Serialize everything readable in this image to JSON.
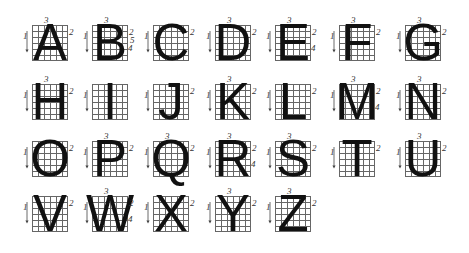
{
  "letters": [
    {
      "char": "A",
      "x": 32,
      "y": 25,
      "strokes": [
        "1",
        "2",
        "3"
      ]
    },
    {
      "char": "B",
      "x": 92,
      "y": 25,
      "strokes": [
        "1",
        "2",
        "3",
        "4",
        "5"
      ]
    },
    {
      "char": "C",
      "x": 153,
      "y": 25,
      "strokes": [
        "1",
        "2"
      ]
    },
    {
      "char": "D",
      "x": 215,
      "y": 25,
      "strokes": [
        "1",
        "2",
        "3"
      ]
    },
    {
      "char": "E",
      "x": 275,
      "y": 25,
      "strokes": [
        "1",
        "2",
        "3",
        "4"
      ]
    },
    {
      "char": "F",
      "x": 339,
      "y": 25,
      "strokes": [
        "1",
        "2",
        "3"
      ]
    },
    {
      "char": "G",
      "x": 405,
      "y": 25,
      "strokes": [
        "1",
        "2",
        "3"
      ]
    },
    {
      "char": "H",
      "x": 32,
      "y": 84,
      "strokes": [
        "1",
        "2",
        "3"
      ]
    },
    {
      "char": "I",
      "x": 92,
      "y": 84,
      "strokes": [
        "1"
      ]
    },
    {
      "char": "J",
      "x": 153,
      "y": 84,
      "strokes": [
        "1",
        "2"
      ]
    },
    {
      "char": "K",
      "x": 215,
      "y": 84,
      "strokes": [
        "1",
        "2",
        "3"
      ]
    },
    {
      "char": "L",
      "x": 275,
      "y": 84,
      "strokes": [
        "1",
        "2"
      ]
    },
    {
      "char": "M",
      "x": 339,
      "y": 84,
      "strokes": [
        "1",
        "2",
        "3",
        "4"
      ]
    },
    {
      "char": "N",
      "x": 405,
      "y": 84,
      "strokes": [
        "1",
        "2",
        "3"
      ]
    },
    {
      "char": "O",
      "x": 32,
      "y": 141,
      "strokes": [
        "1",
        "2"
      ]
    },
    {
      "char": "P",
      "x": 92,
      "y": 141,
      "strokes": [
        "1",
        "2",
        "3"
      ]
    },
    {
      "char": "Q",
      "x": 153,
      "y": 141,
      "strokes": [
        "1",
        "2",
        "3"
      ]
    },
    {
      "char": "R",
      "x": 215,
      "y": 141,
      "strokes": [
        "1",
        "2",
        "3",
        "4"
      ]
    },
    {
      "char": "S",
      "x": 275,
      "y": 141,
      "strokes": [
        "1",
        "2",
        "3"
      ]
    },
    {
      "char": "T",
      "x": 339,
      "y": 141,
      "strokes": [
        "1",
        "2"
      ]
    },
    {
      "char": "U",
      "x": 405,
      "y": 141,
      "strokes": [
        "1",
        "2",
        "3"
      ]
    },
    {
      "char": "V",
      "x": 32,
      "y": 196,
      "strokes": [
        "1",
        "2"
      ]
    },
    {
      "char": "W",
      "x": 92,
      "y": 196,
      "strokes": [
        "1",
        "2",
        "3",
        "4"
      ]
    },
    {
      "char": "X",
      "x": 153,
      "y": 196,
      "strokes": [
        "1",
        "2"
      ]
    },
    {
      "char": "Y",
      "x": 215,
      "y": 196,
      "strokes": [
        "1",
        "2",
        "3"
      ]
    },
    {
      "char": "Z",
      "x": 275,
      "y": 196,
      "strokes": [
        "1",
        "2",
        "3"
      ]
    }
  ]
}
